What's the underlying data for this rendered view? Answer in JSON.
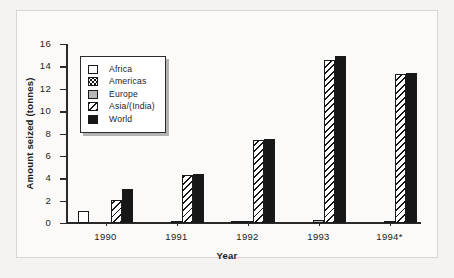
{
  "chart_data": {
    "type": "bar",
    "title": "",
    "xlabel": "Year",
    "ylabel": "Amount seized (tonnes)",
    "categories": [
      "1990",
      "1991",
      "1992",
      "1993",
      "1994*"
    ],
    "ylim": [
      0,
      16
    ],
    "yticks": [
      "0",
      "2",
      "4",
      "6",
      "8",
      "10",
      "12",
      "14",
      "16"
    ],
    "grid": false,
    "legend_position": "upper-left-inside",
    "series": [
      {
        "name": "Africa",
        "pattern": "solid-white",
        "values": [
          1.1,
          0.0,
          0.0,
          0.0,
          0.0
        ]
      },
      {
        "name": "Americas",
        "pattern": "dotted",
        "values": [
          0.0,
          0.0,
          0.15,
          0.0,
          0.0
        ]
      },
      {
        "name": "Europe",
        "pattern": "solid-grey",
        "values": [
          0.0,
          0.12,
          0.12,
          0.25,
          0.1
        ]
      },
      {
        "name": "Asia/(India)",
        "pattern": "diagonal-hatch",
        "values": [
          2.1,
          4.3,
          7.4,
          14.6,
          13.3
        ]
      },
      {
        "name": "World",
        "pattern": "solid-black",
        "values": [
          3.0,
          4.4,
          7.5,
          14.9,
          13.4
        ]
      }
    ]
  },
  "legend": {
    "items": [
      {
        "label": "Africa"
      },
      {
        "label": "Americas"
      },
      {
        "label": "Europe"
      },
      {
        "label": "Asia/(India)"
      },
      {
        "label": "World"
      }
    ]
  },
  "colors": {
    "africa": "#ffffff",
    "europe": "#b9b8b6",
    "world": "#171717",
    "axis": "#2a2a2a",
    "background": "#f4f3f1"
  }
}
